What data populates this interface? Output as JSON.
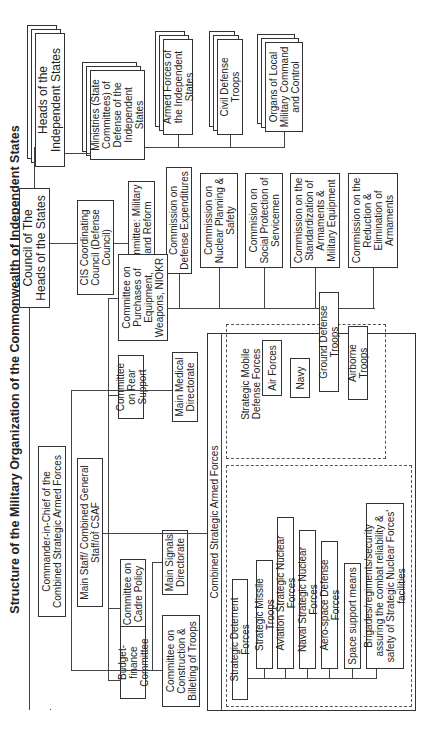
{
  "title": "Structure of the Military Organization of the Commonwealth of Independent States",
  "top": {
    "council": "Council of The Heads of the States",
    "heads": "Heads of the Independent States",
    "ministries": "Ministries (State Committees) of Defense of the Independent States",
    "ministry_children": [
      "Armed Forces of the Independent States",
      "Civil Defense Troops",
      "Organs of Local Military Command and Control"
    ],
    "cis_council": "CIS Coordinating Council (Defense Council)",
    "standing_committee": "Standing Committee: Military Planning and Reform",
    "commissions": [
      "Commission on Defense Expenditures",
      "Commission on Nuclear Planning & Safety",
      "Commision on Social Protection of Servicemen",
      "Commission on the Standardization of Armaments & Military Equipment",
      "Commission on the Reduction & Elimination of Armaments"
    ]
  },
  "command": {
    "commander": "Commander-in-Chief of the Combined Strategic Armed Forces",
    "main_staff": "Main Staff/ Combined General Staff/of CSAF",
    "committees": [
      "Committee on Purchases of Equipment, Weapons, NIOKR",
      "Committee on Rear Support",
      "Committee on Cadre Policy",
      "Budget-finance Committee",
      "Committee on Construction & Billeting of Troops"
    ],
    "directorates": [
      "Main Medical Directorate",
      "Main Signals Directorate"
    ]
  },
  "csaf": {
    "label": "Combined Strategic Armed Forces",
    "mobile": {
      "label": "Strategic Mobile Defense Forces",
      "units": [
        "Air Forces",
        "Navy",
        "Ground Defense Troops",
        "Airborne Troops"
      ]
    },
    "deterrent": {
      "label": "Strategic Deterrent Forces",
      "units": [
        "Strategic Missile Troops",
        "Aviation Strategic Nuclear Forces",
        "Naval Strategic Nuclear Forces",
        "Aero-space Defense Forces",
        "Space support means",
        "Brigades/regiments/security assuring the combat reliability & safety of Strategic Nuclear Forces' facilities"
      ]
    }
  }
}
